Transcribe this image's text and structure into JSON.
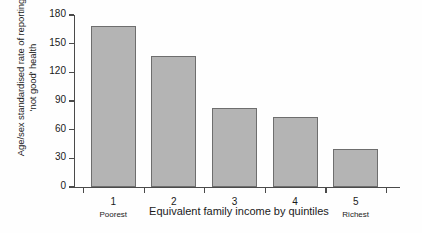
{
  "chart_data": {
    "type": "bar",
    "title": "",
    "categories": [
      "1",
      "2",
      "3",
      "4",
      "5"
    ],
    "values": [
      168,
      137,
      83,
      73,
      40
    ],
    "xlabel": "Equivalent family income by quintiles",
    "ylabel": "Age/sex standardised rate of reporting 'not good' health",
    "ylabel_line1": "Age/sex standardised rate of reporting",
    "ylabel_line2": "'not good' health",
    "ylim": [
      0,
      180
    ],
    "yticks": [
      0,
      30,
      60,
      90,
      120,
      150,
      180
    ],
    "ytick_labels": [
      "0",
      "30",
      "60",
      "90",
      "120",
      "150",
      "180"
    ],
    "category_annotations": {
      "first": "Poorest",
      "last": "Richest"
    },
    "grid": false,
    "legend": false,
    "bar_color": "#b4b4b4",
    "bar_border_color": "#6e6e6e",
    "axis_color": "#4a4a4a",
    "background_color": "#fefefe"
  }
}
